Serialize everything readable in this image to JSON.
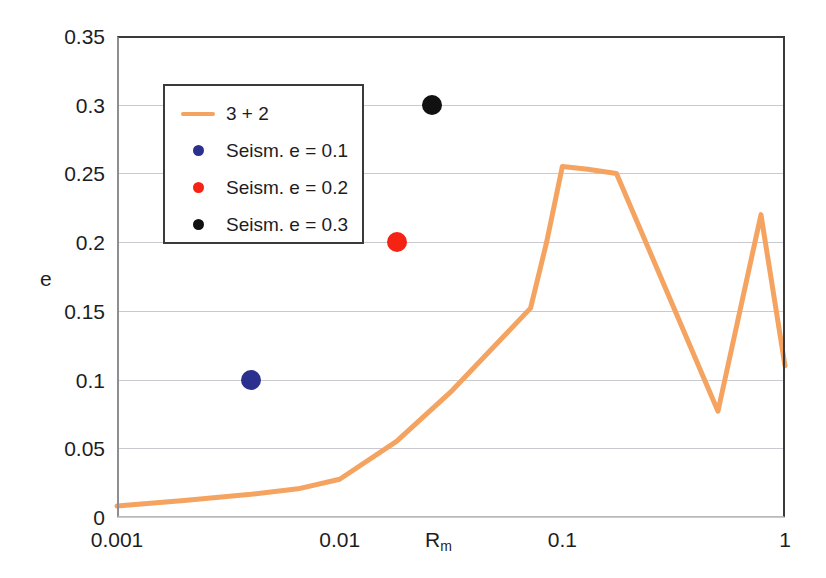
{
  "chart_data": {
    "type": "line",
    "title": "",
    "xlabel": "R_m",
    "xlabel_base": "R",
    "xlabel_sub": "m",
    "ylabel": "e",
    "xscale": "log",
    "xlim": [
      0.001,
      1
    ],
    "ylim": [
      0,
      0.35
    ],
    "grid": true,
    "grid_axis": "y",
    "xticks": [
      "0.001",
      "0.01",
      "0.1",
      "1"
    ],
    "xtick_values": [
      0.001,
      0.01,
      0.1,
      1
    ],
    "yticks": [
      "0",
      "0.05",
      "0.1",
      "0.15",
      "0.2",
      "0.25",
      "0.3",
      "0.35"
    ],
    "ytick_values": [
      0,
      0.05,
      0.1,
      0.15,
      0.2,
      0.25,
      0.3,
      0.35
    ],
    "legend_position": "upper left",
    "series": [
      {
        "name": "3 + 2",
        "type": "line",
        "color": "#F4A460",
        "x": [
          0.001,
          0.002,
          0.004,
          0.0065,
          0.01,
          0.018,
          0.032,
          0.055,
          0.072,
          0.085,
          0.1,
          0.13,
          0.175,
          0.5,
          0.78,
          1.0
        ],
        "y": [
          0.008,
          0.012,
          0.0165,
          0.0205,
          0.0275,
          0.055,
          0.092,
          0.132,
          0.152,
          0.2,
          0.255,
          0.253,
          0.25,
          0.077,
          0.22,
          0.11
        ]
      },
      {
        "name": "Seism. e = 0.1",
        "type": "scatter",
        "color": "#2B2F8E",
        "x": [
          0.004
        ],
        "y": [
          0.1
        ]
      },
      {
        "name": "Seism. e = 0.2",
        "type": "scatter",
        "color": "#F42314",
        "x": [
          0.018
        ],
        "y": [
          0.2
        ]
      },
      {
        "name": "Seism. e = 0.3",
        "type": "scatter",
        "color": "#111111",
        "x": [
          0.026
        ],
        "y": [
          0.3
        ]
      }
    ]
  },
  "legend": {
    "entries": [
      {
        "label": "3 + 2",
        "key": "line",
        "color": "#F4A460"
      },
      {
        "label": "Seism. e = 0.1",
        "key": "dot",
        "color": "#2B2F8E"
      },
      {
        "label": "Seism. e = 0.2",
        "key": "dot",
        "color": "#F42314"
      },
      {
        "label": "Seism. e = 0.3",
        "key": "dot",
        "color": "#111111"
      }
    ]
  },
  "axes": {
    "y_title": "e",
    "x_title_base": "R",
    "x_title_sub": "m",
    "y_ticks": [
      "0.35",
      "0.3",
      "0.25",
      "0.2",
      "0.15",
      "0.1",
      "0.05",
      "0"
    ],
    "x_ticks": [
      "0.001",
      "0.01",
      "0.1",
      "1"
    ]
  },
  "colors": {
    "curve": "#F4A460",
    "seism_01": "#2B2F8E",
    "seism_02": "#F42314",
    "seism_03": "#111111",
    "frame": "#3a3a3c",
    "grid": "#c9c9cf",
    "background": "#ffffff",
    "text": "#1d1d1f"
  }
}
